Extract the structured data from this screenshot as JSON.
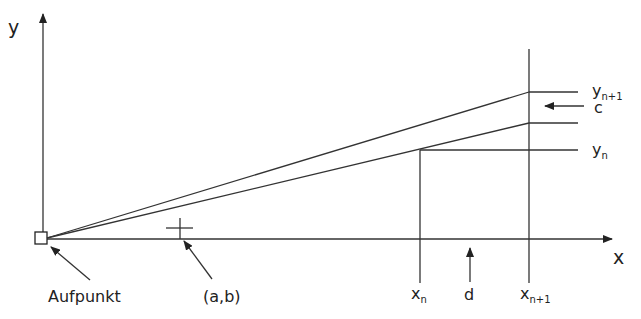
{
  "axes": {
    "x_label": "x",
    "y_label": "y"
  },
  "labels": {
    "origin": "Aufpunkt",
    "point": "(a,b)",
    "xn_base": "x",
    "xn_sub": "n",
    "xn1_base": "x",
    "xn1_sub": "n+1",
    "d": "d",
    "yn_base": "y",
    "yn_sub": "n",
    "yn1_base": "y",
    "yn1_sub": "n+1",
    "c": "c"
  }
}
